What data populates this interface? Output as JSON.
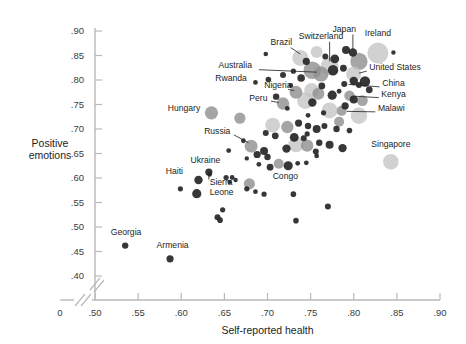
{
  "chart_data": {
    "type": "scatter",
    "title": "",
    "xlabel": "Self-reported health",
    "ylabel": "Positive emotions",
    "xlim": [
      0.475,
      0.905
    ],
    "ylim": [
      0.385,
      0.905
    ],
    "grid": false,
    "legend": "none",
    "axis_break": true,
    "xticks": [
      "0",
      ".50",
      ".55",
      ".60",
      ".65",
      ".70",
      ".75",
      ".80",
      ".85",
      ".90"
    ],
    "xtick_values": [
      0,
      0.5,
      0.55,
      0.6,
      0.65,
      0.7,
      0.75,
      0.8,
      0.85,
      0.9
    ],
    "yticks": [
      ".90",
      ".85",
      ".80",
      ".75",
      ".70",
      ".65",
      ".60",
      ".55",
      ".50",
      ".45",
      ".40"
    ],
    "ytick_values": [
      0.9,
      0.85,
      0.8,
      0.75,
      0.7,
      0.65,
      0.6,
      0.55,
      0.5,
      0.45,
      0.4
    ],
    "size_note": "bubble area encodes country population/sample size",
    "colors": {
      "bubble_dark": "#262626",
      "bubble_mid": "#8f8f8f",
      "bubble_light": "#c6c6c6",
      "axis": "#b9b9b9",
      "text": "#1c1c1c",
      "background": "#ffffff"
    },
    "labeled_points": [
      {
        "name": "Japan",
        "x": 0.799,
        "y": 0.856,
        "r": 4.2,
        "shade": "dark",
        "label_x": 0.789,
        "label_y": 0.898,
        "anchor": "middle",
        "leader": [
          [
            0.799,
            0.893
          ],
          [
            0.799,
            0.862
          ]
        ]
      },
      {
        "name": "Ireland",
        "x": 0.828,
        "y": 0.855,
        "r": 10.5,
        "shade": "light",
        "label_x": 0.828,
        "label_y": 0.889,
        "anchor": "middle",
        "leader": null
      },
      {
        "name": "Switzerland",
        "x": 0.772,
        "y": 0.828,
        "r": 9.0,
        "shade": "light",
        "label_x": 0.762,
        "label_y": 0.884,
        "anchor": "middle",
        "leader": [
          [
            0.772,
            0.878
          ],
          [
            0.772,
            0.838
          ]
        ]
      },
      {
        "name": "Brazil",
        "x": 0.738,
        "y": 0.845,
        "r": 8.0,
        "shade": "light",
        "label_x": 0.716,
        "label_y": 0.872,
        "anchor": "middle",
        "leader": [
          [
            0.727,
            0.866
          ],
          [
            0.738,
            0.853
          ]
        ]
      },
      {
        "name": "Australia",
        "x": 0.762,
        "y": 0.812,
        "r": 7.5,
        "shade": "mid",
        "label_x": 0.682,
        "label_y": 0.824,
        "anchor": "end",
        "leader": [
          [
            0.69,
            0.821
          ],
          [
            0.757,
            0.816
          ]
        ]
      },
      {
        "name": "United States",
        "x": 0.8,
        "y": 0.812,
        "r": 7.6,
        "shade": "light",
        "label_x": 0.818,
        "label_y": 0.82,
        "anchor": "start",
        "leader": [
          [
            0.815,
            0.818
          ],
          [
            0.806,
            0.814
          ]
        ]
      },
      {
        "name": "Rwanda",
        "x": 0.686,
        "y": 0.795,
        "r": 2.4,
        "shade": "dark",
        "label_x": 0.676,
        "label_y": 0.798,
        "anchor": "end",
        "leader": null
      },
      {
        "name": "China",
        "x": 0.789,
        "y": 0.792,
        "r": 3.0,
        "shade": "dark",
        "label_x": 0.833,
        "label_y": 0.787,
        "anchor": "start",
        "leader": [
          [
            0.83,
            0.786
          ],
          [
            0.794,
            0.791
          ]
        ]
      },
      {
        "name": "Nigeria",
        "x": 0.733,
        "y": 0.775,
        "r": 6.4,
        "shade": "mid",
        "label_x": 0.712,
        "label_y": 0.784,
        "anchor": "middle",
        "leader": [
          [
            0.724,
            0.781
          ],
          [
            0.731,
            0.778
          ]
        ]
      },
      {
        "name": "Kenya",
        "x": 0.795,
        "y": 0.768,
        "r": 5.2,
        "shade": "mid",
        "label_x": 0.832,
        "label_y": 0.765,
        "anchor": "start",
        "leader": [
          [
            0.829,
            0.764
          ],
          [
            0.8,
            0.767
          ]
        ]
      },
      {
        "name": "Peru",
        "x": 0.718,
        "y": 0.752,
        "r": 6.2,
        "shade": "mid",
        "label_x": 0.7,
        "label_y": 0.758,
        "anchor": "end",
        "leader": [
          [
            0.704,
            0.757
          ],
          [
            0.713,
            0.754
          ]
        ]
      },
      {
        "name": "Malawi",
        "x": 0.786,
        "y": 0.737,
        "r": 5.0,
        "shade": "mid",
        "label_x": 0.828,
        "label_y": 0.736,
        "anchor": "start",
        "leader": [
          [
            0.825,
            0.735
          ],
          [
            0.792,
            0.736
          ]
        ]
      },
      {
        "name": "Hungary",
        "x": 0.635,
        "y": 0.733,
        "r": 6.6,
        "shade": "mid",
        "label_x": 0.622,
        "label_y": 0.737,
        "anchor": "end",
        "leader": null
      },
      {
        "name": "Russia",
        "x": 0.681,
        "y": 0.665,
        "r": 6.4,
        "shade": "mid",
        "label_x": 0.657,
        "label_y": 0.69,
        "anchor": "end",
        "leader": [
          [
            0.661,
            0.688
          ],
          [
            0.678,
            0.672
          ]
        ]
      },
      {
        "name": "Singapore",
        "x": 0.843,
        "y": 0.633,
        "r": 7.8,
        "shade": "light",
        "label_x": 0.843,
        "label_y": 0.663,
        "anchor": "middle",
        "leader": null
      },
      {
        "name": "Ukraine",
        "x": 0.632,
        "y": 0.612,
        "r": 3.6,
        "shade": "dark",
        "label_x": 0.628,
        "label_y": 0.631,
        "anchor": "middle",
        "leader": [
          [
            0.632,
            0.597
          ],
          [
            0.632,
            0.606
          ]
        ]
      },
      {
        "name": "Haiti",
        "x": 0.633,
        "y": 0.607,
        "r": 2.2,
        "shade": "dark",
        "label_x": 0.602,
        "label_y": 0.609,
        "anchor": "end",
        "leader": null
      },
      {
        "name": "Sierra Leone",
        "x": 0.618,
        "y": 0.568,
        "r": 4.6,
        "shade": "dark",
        "label_x": 0.633,
        "label_y": 0.585,
        "anchor": "start",
        "leader": null
      },
      {
        "name": "Congo",
        "x": 0.679,
        "y": 0.588,
        "r": 5.6,
        "shade": "mid",
        "label_x": 0.706,
        "label_y": 0.598,
        "anchor": "start",
        "leader": null
      },
      {
        "name": "Georgia",
        "x": 0.535,
        "y": 0.462,
        "r": 3.2,
        "shade": "dark",
        "label_x": 0.536,
        "label_y": 0.483,
        "anchor": "middle",
        "leader": null
      },
      {
        "name": "Armenia",
        "x": 0.587,
        "y": 0.435,
        "r": 3.6,
        "shade": "dark",
        "label_x": 0.59,
        "label_y": 0.457,
        "anchor": "middle",
        "leader": null
      }
    ],
    "unlabeled_points": [
      {
        "x": 0.698,
        "y": 0.853,
        "r": 2.3,
        "shade": "dark"
      },
      {
        "x": 0.846,
        "y": 0.856,
        "r": 2.2,
        "shade": "dark"
      },
      {
        "x": 0.757,
        "y": 0.857,
        "r": 6.0,
        "shade": "light"
      },
      {
        "x": 0.791,
        "y": 0.861,
        "r": 4.0,
        "shade": "dark"
      },
      {
        "x": 0.806,
        "y": 0.838,
        "r": 8.6,
        "shade": "mid"
      },
      {
        "x": 0.745,
        "y": 0.838,
        "r": 3.6,
        "shade": "dark"
      },
      {
        "x": 0.778,
        "y": 0.843,
        "r": 4.4,
        "shade": "dark"
      },
      {
        "x": 0.767,
        "y": 0.848,
        "r": 3.0,
        "shade": "dark"
      },
      {
        "x": 0.752,
        "y": 0.82,
        "r": 8.8,
        "shade": "mid"
      },
      {
        "x": 0.776,
        "y": 0.82,
        "r": 5.2,
        "shade": "dark"
      },
      {
        "x": 0.788,
        "y": 0.824,
        "r": 3.4,
        "shade": "dark"
      },
      {
        "x": 0.718,
        "y": 0.81,
        "r": 3.0,
        "shade": "dark"
      },
      {
        "x": 0.739,
        "y": 0.804,
        "r": 3.8,
        "shade": "dark"
      },
      {
        "x": 0.73,
        "y": 0.818,
        "r": 2.6,
        "shade": "dark"
      },
      {
        "x": 0.8,
        "y": 0.798,
        "r": 4.2,
        "shade": "dark"
      },
      {
        "x": 0.813,
        "y": 0.797,
        "r": 5.2,
        "shade": "dark"
      },
      {
        "x": 0.806,
        "y": 0.79,
        "r": 3.0,
        "shade": "dark"
      },
      {
        "x": 0.763,
        "y": 0.788,
        "r": 3.4,
        "shade": "dark"
      },
      {
        "x": 0.751,
        "y": 0.779,
        "r": 7.2,
        "shade": "light"
      },
      {
        "x": 0.759,
        "y": 0.772,
        "r": 6.0,
        "shade": "mid"
      },
      {
        "x": 0.744,
        "y": 0.758,
        "r": 8.4,
        "shade": "light"
      },
      {
        "x": 0.752,
        "y": 0.754,
        "r": 4.2,
        "shade": "dark"
      },
      {
        "x": 0.775,
        "y": 0.769,
        "r": 4.6,
        "shade": "dark"
      },
      {
        "x": 0.783,
        "y": 0.777,
        "r": 2.4,
        "shade": "dark"
      },
      {
        "x": 0.8,
        "y": 0.76,
        "r": 4.0,
        "shade": "dark"
      },
      {
        "x": 0.81,
        "y": 0.758,
        "r": 5.4,
        "shade": "mid"
      },
      {
        "x": 0.79,
        "y": 0.747,
        "r": 3.6,
        "shade": "dark"
      },
      {
        "x": 0.772,
        "y": 0.738,
        "r": 8.0,
        "shade": "light"
      },
      {
        "x": 0.806,
        "y": 0.727,
        "r": 8.2,
        "shade": "light"
      },
      {
        "x": 0.783,
        "y": 0.715,
        "r": 5.0,
        "shade": "mid"
      },
      {
        "x": 0.668,
        "y": 0.722,
        "r": 5.6,
        "shade": "mid"
      },
      {
        "x": 0.706,
        "y": 0.708,
        "r": 7.4,
        "shade": "light"
      },
      {
        "x": 0.723,
        "y": 0.704,
        "r": 6.2,
        "shade": "mid"
      },
      {
        "x": 0.736,
        "y": 0.712,
        "r": 3.6,
        "shade": "dark"
      },
      {
        "x": 0.747,
        "y": 0.706,
        "r": 3.2,
        "shade": "dark"
      },
      {
        "x": 0.757,
        "y": 0.7,
        "r": 4.0,
        "shade": "dark"
      },
      {
        "x": 0.766,
        "y": 0.706,
        "r": 3.0,
        "shade": "dark"
      },
      {
        "x": 0.78,
        "y": 0.7,
        "r": 3.2,
        "shade": "dark"
      },
      {
        "x": 0.795,
        "y": 0.697,
        "r": 2.8,
        "shade": "dark"
      },
      {
        "x": 0.698,
        "y": 0.692,
        "r": 3.0,
        "shade": "dark"
      },
      {
        "x": 0.709,
        "y": 0.686,
        "r": 3.4,
        "shade": "dark"
      },
      {
        "x": 0.731,
        "y": 0.683,
        "r": 4.4,
        "shade": "dark"
      },
      {
        "x": 0.742,
        "y": 0.681,
        "r": 3.0,
        "shade": "dark"
      },
      {
        "x": 0.733,
        "y": 0.668,
        "r": 7.6,
        "shade": "light"
      },
      {
        "x": 0.746,
        "y": 0.666,
        "r": 6.2,
        "shade": "mid"
      },
      {
        "x": 0.722,
        "y": 0.66,
        "r": 4.2,
        "shade": "dark"
      },
      {
        "x": 0.76,
        "y": 0.672,
        "r": 3.2,
        "shade": "dark"
      },
      {
        "x": 0.772,
        "y": 0.668,
        "r": 4.0,
        "shade": "dark"
      },
      {
        "x": 0.787,
        "y": 0.661,
        "r": 4.2,
        "shade": "dark"
      },
      {
        "x": 0.756,
        "y": 0.654,
        "r": 3.0,
        "shade": "dark"
      },
      {
        "x": 0.696,
        "y": 0.655,
        "r": 4.0,
        "shade": "dark"
      },
      {
        "x": 0.688,
        "y": 0.648,
        "r": 3.6,
        "shade": "dark"
      },
      {
        "x": 0.7,
        "y": 0.643,
        "r": 3.2,
        "shade": "dark"
      },
      {
        "x": 0.655,
        "y": 0.656,
        "r": 2.4,
        "shade": "dark"
      },
      {
        "x": 0.676,
        "y": 0.64,
        "r": 2.2,
        "shade": "dark"
      },
      {
        "x": 0.713,
        "y": 0.629,
        "r": 5.0,
        "shade": "mid"
      },
      {
        "x": 0.724,
        "y": 0.625,
        "r": 4.6,
        "shade": "dark"
      },
      {
        "x": 0.735,
        "y": 0.63,
        "r": 2.4,
        "shade": "dark"
      },
      {
        "x": 0.745,
        "y": 0.631,
        "r": 2.4,
        "shade": "dark"
      },
      {
        "x": 0.703,
        "y": 0.622,
        "r": 3.4,
        "shade": "dark"
      },
      {
        "x": 0.69,
        "y": 0.628,
        "r": 2.4,
        "shade": "dark"
      },
      {
        "x": 0.652,
        "y": 0.601,
        "r": 2.6,
        "shade": "dark"
      },
      {
        "x": 0.659,
        "y": 0.601,
        "r": 2.4,
        "shade": "dark"
      },
      {
        "x": 0.62,
        "y": 0.596,
        "r": 4.2,
        "shade": "dark"
      },
      {
        "x": 0.599,
        "y": 0.578,
        "r": 2.6,
        "shade": "dark"
      },
      {
        "x": 0.676,
        "y": 0.578,
        "r": 2.6,
        "shade": "dark"
      },
      {
        "x": 0.686,
        "y": 0.572,
        "r": 2.4,
        "shade": "dark"
      },
      {
        "x": 0.696,
        "y": 0.567,
        "r": 2.6,
        "shade": "dark"
      },
      {
        "x": 0.73,
        "y": 0.567,
        "r": 2.8,
        "shade": "dark"
      },
      {
        "x": 0.656,
        "y": 0.592,
        "r": 2.2,
        "shade": "dark"
      },
      {
        "x": 0.648,
        "y": 0.535,
        "r": 2.6,
        "shade": "dark"
      },
      {
        "x": 0.642,
        "y": 0.52,
        "r": 3.0,
        "shade": "dark"
      },
      {
        "x": 0.645,
        "y": 0.514,
        "r": 2.8,
        "shade": "dark"
      },
      {
        "x": 0.733,
        "y": 0.513,
        "r": 2.8,
        "shade": "dark"
      },
      {
        "x": 0.77,
        "y": 0.542,
        "r": 3.0,
        "shade": "dark"
      },
      {
        "x": 0.663,
        "y": 0.596,
        "r": 2.2,
        "shade": "dark"
      },
      {
        "x": 0.746,
        "y": 0.69,
        "r": 2.6,
        "shade": "dark"
      },
      {
        "x": 0.765,
        "y": 0.733,
        "r": 2.6,
        "shade": "dark"
      },
      {
        "x": 0.723,
        "y": 0.742,
        "r": 2.4,
        "shade": "dark"
      },
      {
        "x": 0.71,
        "y": 0.766,
        "r": 3.2,
        "shade": "dark"
      },
      {
        "x": 0.727,
        "y": 0.789,
        "r": 2.4,
        "shade": "dark"
      },
      {
        "x": 0.701,
        "y": 0.801,
        "r": 2.8,
        "shade": "dark"
      },
      {
        "x": 0.747,
        "y": 0.728,
        "r": 2.4,
        "shade": "dark"
      },
      {
        "x": 0.818,
        "y": 0.78,
        "r": 3.4,
        "shade": "dark"
      },
      {
        "x": 0.757,
        "y": 0.645,
        "r": 2.4,
        "shade": "dark"
      },
      {
        "x": 0.672,
        "y": 0.676,
        "r": 2.4,
        "shade": "dark"
      }
    ]
  }
}
